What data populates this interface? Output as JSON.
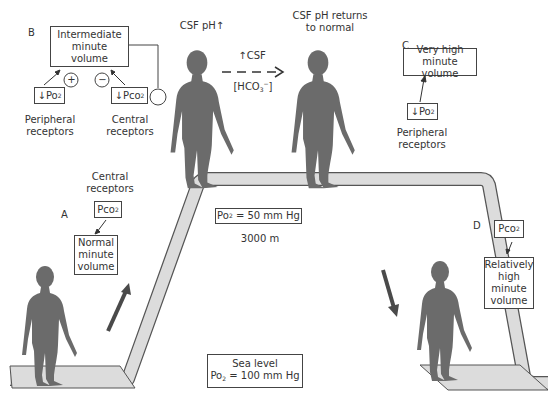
{
  "panels": {
    "A": {
      "letter": "A",
      "receptor_label_1": "Central",
      "receptor_label_2": "receptors",
      "stimulus": "Pco",
      "stimulus_sub": "2",
      "result_1": "Normal",
      "result_2": "minute",
      "result_3": "volume"
    },
    "B": {
      "letter": "B",
      "result_1": "Intermediate",
      "result_2": "minute",
      "result_3": "volume",
      "plus_sign": "+",
      "minus_sign": "−",
      "stimulus_left": "↓Po",
      "stimulus_left_sub": "2",
      "stimulus_right": "↓Pco",
      "stimulus_right_sub": "2",
      "receptor_left_1": "Peripheral",
      "receptor_left_2": "receptors",
      "receptor_right_1": "Central",
      "receptor_right_2": "receptors",
      "csf_title": "CSF pH↑"
    },
    "transition": {
      "top_text": "↑CSF",
      "bottom_text": "[HCO",
      "bottom_sub": "3",
      "bottom_sup": "−",
      "bottom_close": "]",
      "right_title_1": "CSF pH returns",
      "right_title_2": "to normal"
    },
    "C": {
      "letter": "C",
      "result_1": "Very high",
      "result_2": "minute volume",
      "stimulus": "↓Po",
      "stimulus_sub": "2",
      "receptor_1": "Peripheral",
      "receptor_2": "receptors"
    },
    "D": {
      "letter": "D",
      "stimulus": "Pco",
      "stimulus_sub": "2",
      "result_1": "Relatively",
      "result_2": "high",
      "result_3": "minute",
      "result_4": "volume"
    }
  },
  "altitude": {
    "po2_label": "Po",
    "po2_sub": "2",
    "po2_value": " = 50 mm Hg",
    "height": "3000 m"
  },
  "sea_level": {
    "title": "Sea level",
    "po2_label": "Po",
    "po2_sub": "2",
    "po2_value": " = 100 mm Hg"
  },
  "colors": {
    "figure": "#6b6b6b",
    "path_fill": "#dcdcdc",
    "path_stroke": "#555555",
    "arrow": "#4a4a4a"
  }
}
